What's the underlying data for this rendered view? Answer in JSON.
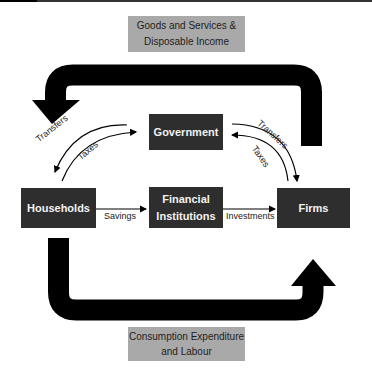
{
  "diagram": {
    "type": "circular flow of income",
    "top_flow_label": "Goods and Services & Disposable Income",
    "top_flow_label_lines": [
      "Goods and Services &",
      "Disposable Income"
    ],
    "bottom_flow_label": "Consumption Expenditure and Labour",
    "bottom_flow_label_lines": [
      "Consumption Expenditure",
      "and Labour"
    ],
    "nodes": {
      "government": "Government",
      "households": "Households",
      "financial": [
        "Financial",
        "Institutions"
      ],
      "firms": "Firms"
    },
    "edges": {
      "savings": "Savings",
      "investments": "Investments",
      "hh_transfers": "Transfers",
      "hh_taxes": "Taxes",
      "firm_transfers": "Transfers",
      "firm_taxes": "Taxes"
    },
    "colors": {
      "node_fill": "#2e2e2e",
      "node_text": "#f2f2f2",
      "label_fill": "#a9a9a9",
      "arrow": "#000000"
    }
  }
}
